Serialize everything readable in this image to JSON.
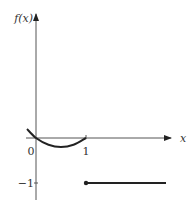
{
  "chart_data": {
    "type": "line",
    "title": "",
    "xlabel": "x",
    "ylabel": "f(x)",
    "xlim": [
      -0.2,
      2.8
    ],
    "ylim": [
      -1.35,
      2.3
    ],
    "origin_label": "0",
    "x_ticks": [
      {
        "value": 1,
        "label": "1"
      }
    ],
    "y_ticks": [
      {
        "value": -1,
        "label": "−1"
      }
    ],
    "grid": false,
    "series": [
      {
        "name": "parabola-piece",
        "x": [
          -0.18,
          0,
          0.25,
          0.5,
          0.75,
          1
        ],
        "y": [
          0.2,
          0,
          -0.15,
          -0.2,
          -0.15,
          0
        ]
      },
      {
        "name": "constant-piece",
        "x": [
          1,
          2.6
        ],
        "y": [
          -1,
          -1
        ],
        "start_point": "closed"
      }
    ]
  }
}
